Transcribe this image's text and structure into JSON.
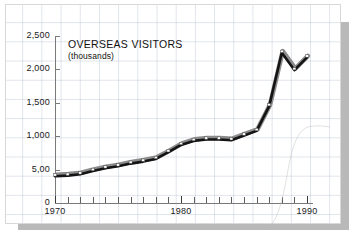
{
  "figure": {
    "title": "OVERSEAS VISITORS",
    "subtitle": "(thousands)",
    "background_color": "#ffffff",
    "grid_color": "#96a8be",
    "shadow_color": "#b9b9b9",
    "line_color": "#141414",
    "line_highlight_color": "#8c8c8c",
    "marker_fill": "#ffffff"
  },
  "axes": {
    "y_ticks": [
      "2,500",
      "2,000",
      "1,500",
      "1,000",
      "5,00",
      "0"
    ],
    "x_ticks": [
      "1970",
      "1980",
      "1990"
    ]
  },
  "chart_data": {
    "type": "line",
    "title": "OVERSEAS VISITORS",
    "subtitle": "(thousands)",
    "xlabel": "",
    "ylabel": "thousands",
    "ylim": [
      0,
      2500
    ],
    "xlim": [
      1970,
      1990
    ],
    "grid": true,
    "legend": "none",
    "y_tick_values": [
      0,
      500,
      1000,
      1500,
      2000,
      2500
    ],
    "y_tick_labels": [
      "0",
      "5,00",
      "1,000",
      "1,500",
      "2,000",
      "2,500"
    ],
    "x_tick_values": [
      1970,
      1980,
      1990
    ],
    "x_tick_labels": [
      "1970",
      "1980",
      "1990"
    ],
    "x": [
      1970,
      1971,
      1972,
      1973,
      1974,
      1975,
      1976,
      1977,
      1978,
      1979,
      1980,
      1981,
      1982,
      1983,
      1984,
      1985,
      1986,
      1987,
      1988,
      1989,
      1990
    ],
    "values": [
      400,
      410,
      430,
      480,
      520,
      550,
      590,
      620,
      660,
      760,
      870,
      930,
      950,
      950,
      940,
      1010,
      1080,
      1450,
      2250,
      1990,
      2180
    ],
    "series": [
      {
        "name": "Overseas visitors",
        "values": [
          400,
          410,
          430,
          480,
          520,
          550,
          590,
          620,
          660,
          760,
          870,
          930,
          950,
          950,
          940,
          1010,
          1080,
          1450,
          2250,
          1990,
          2180
        ]
      }
    ],
    "annotations": [
      "peak at 1988 of about 2,250 thousand",
      "dip at 1989 to about 2,000 thousand"
    ]
  }
}
